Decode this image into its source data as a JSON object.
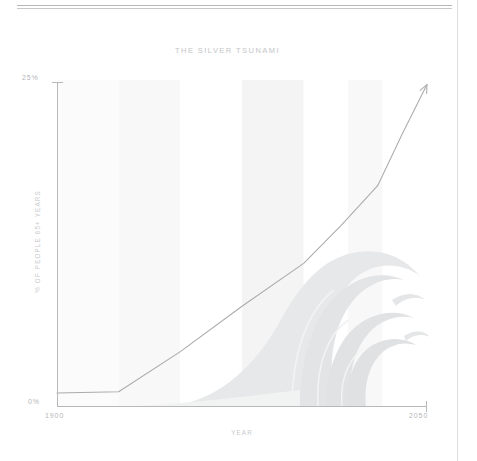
{
  "page": {
    "background_color": "#ffffff",
    "rule_color": "#b4b6b8",
    "side_rule_color": "#dcdedf"
  },
  "chart_data": {
    "type": "line",
    "title": "THE SILVER TSUNAMI",
    "xlabel": "YEAR",
    "ylabel": "% OF PEOPLE 65+ YEARS",
    "xlim": [
      1900,
      2050
    ],
    "ylim": [
      0,
      25
    ],
    "xtick_labels": [
      "1900",
      "2050"
    ],
    "ytick_labels": [
      "0%",
      "25%"
    ],
    "grid": false,
    "legend": null,
    "line_color": "#a9abad",
    "arrow_end": true,
    "series": [
      {
        "name": "% of people 65+ years",
        "x": [
          1900,
          1900,
          1925,
          1950,
          1975,
          2000,
          2015,
          2030,
          2040,
          2050
        ],
        "values": [
          1.0,
          1.0,
          1.1,
          4.2,
          7.7,
          11.0,
          13.9,
          17.0,
          21.0,
          24.8
        ]
      }
    ],
    "shaded_bands": [
      {
        "x_start": 1900,
        "x_end": 1925,
        "color": "#fbfbfb"
      },
      {
        "x_start": 1925,
        "x_end": 1950,
        "color": "#f8f8f8"
      },
      {
        "x_start": 1950,
        "x_end": 1975,
        "color": "#ffffff"
      },
      {
        "x_start": 1975,
        "x_end": 2000,
        "color": "#f4f4f4"
      },
      {
        "x_start": 2000,
        "x_end": 2018,
        "color": "#ffffff"
      },
      {
        "x_start": 2018,
        "x_end": 2032,
        "color": "#f8f8f8"
      },
      {
        "x_start": 2032,
        "x_end": 2050,
        "color": "#ffffff"
      }
    ],
    "background_illustration": "breaking-wave",
    "wave_color": "#e5e6e7",
    "annotation": "Rising share of population aged 65 and over, 1900 to 2050, illustrated as a breaking wave."
  }
}
